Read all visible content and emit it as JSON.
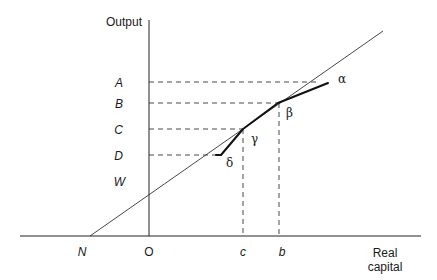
{
  "axes": {
    "y_label": "Output",
    "x_label_line1": "Real",
    "x_label_line2": "capital"
  },
  "y_ticks": {
    "A": "A",
    "B": "B",
    "C": "C",
    "D": "D",
    "W": "W"
  },
  "x_ticks": {
    "N": "N",
    "O": "O",
    "c": "c",
    "b": "b"
  },
  "points": {
    "alpha": "α",
    "beta": "β",
    "gamma": "γ",
    "delta": "δ"
  },
  "colors": {
    "line": "#222222",
    "background": "#ffffff"
  }
}
